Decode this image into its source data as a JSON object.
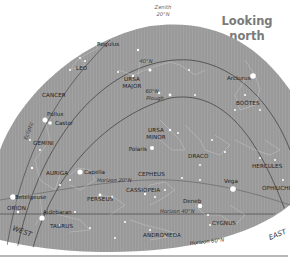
{
  "title": {
    "line1": "Looking",
    "line2": "north"
  },
  "zenith": {
    "line1": "Zenith",
    "line2": "20°N"
  },
  "directions": {
    "west": "WEST",
    "east": "EAST"
  },
  "lines": {
    "lat40": "40°N",
    "lat60": "60°N",
    "ecliptic": "Ecliptic",
    "horizon20": "Horizon 20°N",
    "horizon40": "Horizon 40°N",
    "horizon60": "Horizon 60°N"
  },
  "constellations": {
    "leo": "LEO",
    "ursa_major_1": "URSA",
    "ursa_major_2": "MAJOR",
    "cancer": "CANCER",
    "bootes": "BOÖTES",
    "ursa_minor_1": "URSA",
    "ursa_minor_2": "MINOR",
    "gemini": "GEMINI",
    "draco": "DRACO",
    "hercules": "HERCULES",
    "auriga": "AURIGA",
    "cepheus": "CEPHEUS",
    "ophiuchus": "OPHIUCHUS",
    "cassiopeia": "CASSIOPEIA",
    "perseus": "PERSEUS",
    "orion": "ORION",
    "taurus": "TAURUS",
    "cygnus": "CYGNUS",
    "andromeda": "ANDROMEDA"
  },
  "stars": {
    "regulus": "Regulus",
    "arcturus": "Arcturus",
    "plough": "Plough",
    "pollux": "Pollux",
    "castor": "Castor",
    "polaris": "Polaris",
    "capella": "Capella",
    "vega": "Vega",
    "betelgeuse": "Betelgeuse",
    "aldebaran": "Aldebaran",
    "deneb": "Deneb"
  },
  "colors": {
    "sky": "#9a9a9a",
    "line": "#3a3a3a",
    "star": "#ffffff",
    "title": "#7a7a7a",
    "footer_rule": "#6e6e6e"
  }
}
